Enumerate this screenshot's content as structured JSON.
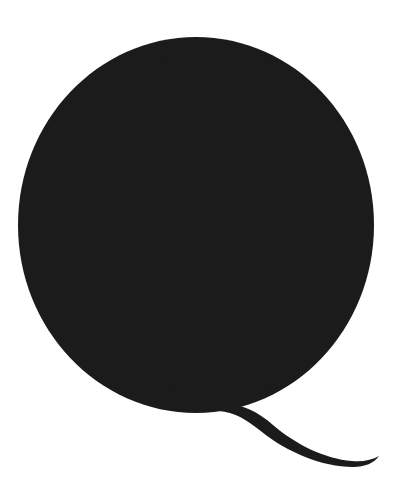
{
  "image": {
    "kind": "letterform-specimen",
    "subject": "Letter Q",
    "character": "Q",
    "case": "uppercase",
    "style": "serif didone high-contrast",
    "caption": "Q",
    "background_color": "#ffffff",
    "ink_color": "#1b1b1b",
    "canvas": {
      "width_px": 399,
      "height_px": 498
    }
  },
  "glyph": {
    "name": "uppercase-q",
    "bowl": {
      "outer": {
        "center_x": 196,
        "center_y": 225,
        "radius_x": 178,
        "radius_y": 188,
        "left_px": 18,
        "right_px": 374,
        "top_px": 37,
        "bottom_px": 413
      },
      "counter": {
        "center_x": 219,
        "center_y": 223,
        "radius_x": 139,
        "radius_y": 176,
        "left_px": 80,
        "right_px": 358,
        "top_px": 47,
        "bottom_px": 399
      },
      "stroke_weight": {
        "left_px": 62,
        "right_px": 18,
        "top_px": 10,
        "bottom_px": 13
      }
    },
    "tail": {
      "junction_x": 228,
      "junction_y": 408,
      "tip_x": 379,
      "tip_y": 463,
      "max_thickness_px": 9
    }
  },
  "paths": {
    "bowl_outer": "M 196 37 C 294 37 374 121 374 225 C 374 329 294 413 196 413 C 98 413 18 329 18 225 C 18 121 98 37 196 37 Z",
    "bowl_counter": "M 219 47 C 296 47 358 126 358 223 C 358 320 296 399 219 399 C 142 399 80 320 80 223 C 80 126 142 47 219 47 Z",
    "tail": "M 222 403 C 243 404 258 412 273 425 C 295 444 325 459 352 461 C 363 462 372 460 379 456 C 374 463 365 467 353 467 C 322 467 287 452 262 432 C 246 419 234 412 219 411 Z"
  }
}
